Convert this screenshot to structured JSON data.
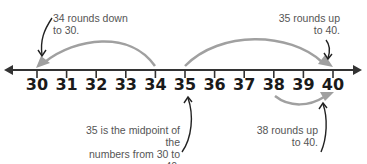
{
  "diagram": {
    "number_line": {
      "ticks": [
        "30",
        "31",
        "32",
        "33",
        "34",
        "35",
        "36",
        "37",
        "38",
        "39",
        "40"
      ],
      "line_color": "#333333",
      "arrow_color": "#999999"
    },
    "annotations": {
      "round_down_34": {
        "line1": "34 rounds down",
        "line2": "to 30."
      },
      "round_up_35": {
        "line1": "35 rounds up",
        "line2": "to 40."
      },
      "midpoint_35": {
        "line1": "35 is the midpoint of the",
        "line2": "numbers from 30 to 40."
      },
      "round_up_38": {
        "line1": "38 rounds up",
        "line2": "to 40."
      }
    }
  }
}
